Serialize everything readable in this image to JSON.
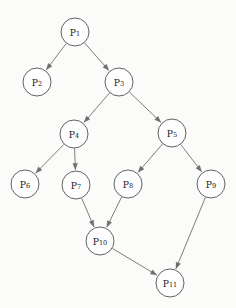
{
  "diagram": {
    "background_color": "#fbfbfa",
    "node_fill_color": "#fefefe",
    "node_stroke_color": "#5a5a5a",
    "edge_color": "#6e6e6e",
    "node_radius": 14,
    "nodes": [
      {
        "id": "P1",
        "label": "P",
        "subscript": "1",
        "cx": 75,
        "cy": 32
      },
      {
        "id": "P2",
        "label": "P",
        "subscript": "2",
        "cx": 37,
        "cy": 82
      },
      {
        "id": "P3",
        "label": "P",
        "subscript": "3",
        "cx": 119,
        "cy": 82
      },
      {
        "id": "P4",
        "label": "P",
        "subscript": "4",
        "cx": 74,
        "cy": 134
      },
      {
        "id": "P5",
        "label": "P",
        "subscript": "5",
        "cx": 172,
        "cy": 133
      },
      {
        "id": "P6",
        "label": "P",
        "subscript": "6",
        "cx": 25,
        "cy": 184
      },
      {
        "id": "P7",
        "label": "P",
        "subscript": "7",
        "cx": 76,
        "cy": 185
      },
      {
        "id": "P8",
        "label": "P",
        "subscript": "8",
        "cx": 128,
        "cy": 184
      },
      {
        "id": "P9",
        "label": "P",
        "subscript": "9",
        "cx": 211,
        "cy": 184
      },
      {
        "id": "P10",
        "label": "P",
        "subscript": "10",
        "cx": 100,
        "cy": 241
      },
      {
        "id": "P11",
        "label": "P",
        "subscript": "11",
        "cx": 170,
        "cy": 283
      }
    ],
    "edges": [
      {
        "from": "P1",
        "to": "P2"
      },
      {
        "from": "P1",
        "to": "P3"
      },
      {
        "from": "P3",
        "to": "P4"
      },
      {
        "from": "P3",
        "to": "P5"
      },
      {
        "from": "P4",
        "to": "P6"
      },
      {
        "from": "P4",
        "to": "P7"
      },
      {
        "from": "P5",
        "to": "P8"
      },
      {
        "from": "P5",
        "to": "P9"
      },
      {
        "from": "P7",
        "to": "P10"
      },
      {
        "from": "P8",
        "to": "P10"
      },
      {
        "from": "P9",
        "to": "P11"
      },
      {
        "from": "P10",
        "to": "P11"
      }
    ]
  }
}
